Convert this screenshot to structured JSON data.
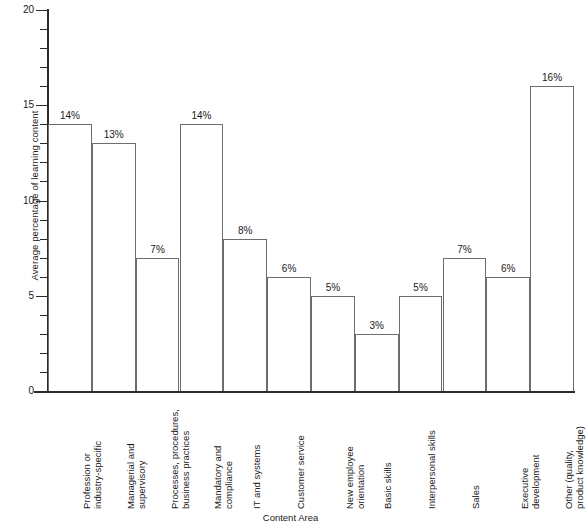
{
  "chart_data": {
    "type": "bar",
    "title": "",
    "xlabel": "Content Area",
    "ylabel": "Average percentage of learning content",
    "ylim": [
      0,
      20
    ],
    "y_major_ticks": [
      0,
      5,
      10,
      15,
      20
    ],
    "y_minor_tick_interval": 1,
    "grid": false,
    "legend": false,
    "value_label_suffix": "%",
    "categories": [
      "Profession or\nindustry-specific",
      "Managerial and\nsupervisory",
      "Processes, procedures,\nbusiness practices",
      "Mandatory and\ncompliance",
      "IT and systems",
      "Customer service",
      "New employee\norientation",
      "Basic skills",
      "Interpersonal skills",
      "Sales",
      "Executive\ndevelopment",
      "Other (quality,\nproduct knowledge)"
    ],
    "values": [
      14,
      13,
      7,
      14,
      8,
      6,
      5,
      3,
      5,
      7,
      6,
      16
    ],
    "value_labels": [
      "14%",
      "13%",
      "7%",
      "14%",
      "8%",
      "6%",
      "5%",
      "3%",
      "5%",
      "7%",
      "6%",
      "16%"
    ],
    "y_tick_labels": [
      "0",
      "5",
      "10",
      "15",
      "20"
    ],
    "colors": {
      "background": "#ffffff",
      "bar_fill": "#ffffff",
      "bar_stroke": "#6d6d6d",
      "axis": "#2b2b2b",
      "text": "#1a1a1a"
    }
  }
}
